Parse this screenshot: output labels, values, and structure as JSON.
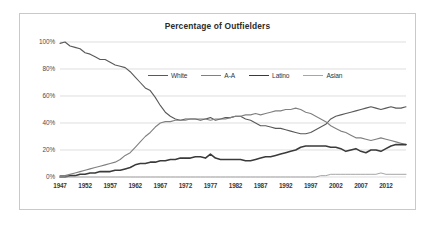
{
  "chart_data": {
    "type": "line",
    "title": "Percentage of Outfielders",
    "xlabel": "",
    "ylabel": "",
    "grid": true,
    "legend_position": "inside-top-center",
    "xlim": [
      1947,
      2016
    ],
    "ylim": [
      0,
      100
    ],
    "yticks": [
      "0%",
      "20%",
      "40%",
      "60%",
      "80%",
      "100%"
    ],
    "ytick_values": [
      0,
      20,
      40,
      60,
      80,
      100
    ],
    "xticks": [
      "1947",
      "1952",
      "1957",
      "1962",
      "1967",
      "1972",
      "1977",
      "1982",
      "1987",
      "1992",
      "1997",
      "2002",
      "2007",
      "2012"
    ],
    "xtick_values": [
      1947,
      1952,
      1957,
      1962,
      1967,
      1972,
      1977,
      1982,
      1987,
      1992,
      1997,
      2002,
      2007,
      2012
    ],
    "x": [
      1947,
      1948,
      1949,
      1950,
      1951,
      1952,
      1953,
      1954,
      1955,
      1956,
      1957,
      1958,
      1959,
      1960,
      1961,
      1962,
      1963,
      1964,
      1965,
      1966,
      1967,
      1968,
      1969,
      1970,
      1971,
      1972,
      1973,
      1974,
      1975,
      1976,
      1977,
      1978,
      1979,
      1980,
      1981,
      1982,
      1983,
      1984,
      1985,
      1986,
      1987,
      1988,
      1989,
      1990,
      1991,
      1992,
      1993,
      1994,
      1995,
      1996,
      1997,
      1998,
      1999,
      2000,
      2001,
      2002,
      2003,
      2004,
      2005,
      2006,
      2007,
      2008,
      2009,
      2010,
      2011,
      2012,
      2013,
      2014,
      2015,
      2016
    ],
    "series": [
      {
        "name": "White",
        "color": "#595959",
        "width": 1.1,
        "values": [
          99,
          100,
          97,
          96,
          95,
          92,
          91,
          89,
          87,
          87,
          85,
          83,
          82,
          81,
          78,
          74,
          70,
          66,
          64,
          59,
          53,
          48,
          45,
          43,
          42,
          43,
          43,
          43,
          42,
          43,
          44,
          42,
          43,
          44,
          44,
          45,
          45,
          43,
          42,
          40,
          38,
          38,
          37,
          36,
          36,
          35,
          34,
          33,
          32,
          32,
          33,
          35,
          37,
          39,
          43,
          45,
          46,
          47,
          48,
          49,
          50,
          51,
          52,
          51,
          50,
          51,
          52,
          51,
          51,
          52
        ]
      },
      {
        "name": "A-A",
        "color": "#808080",
        "width": 1.1,
        "values": [
          1,
          1,
          2,
          3,
          4,
          5,
          6,
          7,
          8,
          9,
          10,
          11,
          13,
          16,
          18,
          22,
          26,
          30,
          33,
          37,
          40,
          41,
          41,
          42,
          42,
          42,
          43,
          43,
          43,
          43,
          42,
          43,
          43,
          43,
          44,
          45,
          45,
          46,
          46,
          47,
          46,
          47,
          48,
          49,
          49,
          50,
          50,
          51,
          50,
          48,
          47,
          45,
          43,
          41,
          38,
          36,
          34,
          33,
          31,
          29,
          29,
          28,
          27,
          28,
          29,
          28,
          27,
          26,
          25,
          24
        ]
      },
      {
        "name": "Latino",
        "color": "#3a3a3a",
        "width": 1.6,
        "values": [
          0,
          0,
          1,
          1,
          2,
          2,
          3,
          3,
          4,
          4,
          4,
          5,
          5,
          6,
          7,
          9,
          10,
          10,
          11,
          11,
          12,
          12,
          13,
          13,
          14,
          14,
          14,
          15,
          15,
          14,
          17,
          14,
          13,
          13,
          13,
          13,
          13,
          12,
          12,
          13,
          14,
          15,
          15,
          16,
          17,
          18,
          19,
          20,
          22,
          23,
          23,
          23,
          23,
          23,
          22,
          22,
          21,
          19,
          20,
          21,
          19,
          18,
          20,
          20,
          19,
          21,
          23,
          24,
          24,
          24
        ]
      },
      {
        "name": "Asian",
        "color": "#a6a6a6",
        "width": 1.0,
        "values": [
          0,
          0,
          0,
          0,
          0,
          0,
          0,
          0,
          0,
          0,
          0,
          0,
          0,
          0,
          0,
          0,
          0,
          0,
          0,
          0,
          0,
          0,
          0,
          0,
          0,
          0,
          0,
          0,
          0,
          0,
          0,
          0,
          0,
          0,
          0,
          0,
          0,
          0,
          0,
          0,
          0,
          0,
          0,
          0,
          0,
          0,
          0,
          0,
          0,
          0,
          0,
          0,
          1,
          1,
          2,
          2,
          2,
          2,
          2,
          2,
          2,
          2,
          2,
          2,
          3,
          2,
          2,
          2,
          2,
          2
        ]
      }
    ]
  },
  "style": {
    "grid_color": "#d0d0d0",
    "axis_color": "#b0b0b0",
    "border_color": "#c9c9c9",
    "title_color": "#2b2b2b",
    "background": "#ffffff"
  }
}
